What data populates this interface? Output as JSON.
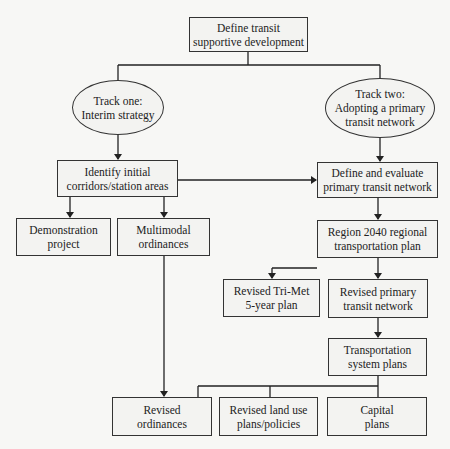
{
  "diagram": {
    "type": "flowchart",
    "root": {
      "lines": [
        "Define transit",
        "supportive development"
      ]
    },
    "track_one": {
      "lines": [
        "Track one:",
        "Interim strategy"
      ]
    },
    "track_two": {
      "lines": [
        "Track two:",
        "Adopting a primary",
        "transit network"
      ]
    },
    "identify": {
      "lines": [
        "Identify initial",
        "corridors/station areas"
      ]
    },
    "define_evaluate": {
      "lines": [
        "Define and evaluate",
        "primary transit network"
      ]
    },
    "demonstration": {
      "lines": [
        "Demonstration",
        "project"
      ]
    },
    "multimodal": {
      "lines": [
        "Multimodal",
        "ordinances"
      ]
    },
    "region2040": {
      "lines": [
        "Region 2040 regional",
        "transportation plan"
      ]
    },
    "trimet": {
      "lines": [
        "Revised Tri-Met",
        "5-year plan"
      ]
    },
    "revised_network": {
      "lines": [
        "Revised primary",
        "transit network"
      ]
    },
    "tsp": {
      "lines": [
        "Transportation",
        "system plans"
      ]
    },
    "revised_ordinances": {
      "lines": [
        "Revised",
        "ordinances"
      ]
    },
    "land_use": {
      "lines": [
        "Revised land use",
        "plans/policies"
      ]
    },
    "capital": {
      "lines": [
        "Capital",
        "plans"
      ]
    },
    "edges": [
      [
        "root",
        "track_one"
      ],
      [
        "root",
        "track_two"
      ],
      [
        "track_one",
        "identify"
      ],
      [
        "track_two",
        "define_evaluate"
      ],
      [
        "identify",
        "define_evaluate"
      ],
      [
        "identify",
        "demonstration"
      ],
      [
        "identify",
        "multimodal"
      ],
      [
        "define_evaluate",
        "region2040"
      ],
      [
        "region2040",
        "trimet"
      ],
      [
        "region2040",
        "revised_network"
      ],
      [
        "revised_network",
        "tsp"
      ],
      [
        "multimodal",
        "revised_ordinances"
      ],
      [
        "tsp",
        "revised_ordinances"
      ],
      [
        "tsp",
        "land_use"
      ],
      [
        "tsp",
        "capital"
      ]
    ]
  }
}
